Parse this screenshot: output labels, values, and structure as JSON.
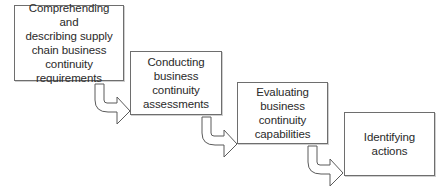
{
  "diagram": {
    "type": "process-flow-staircase",
    "steps": [
      {
        "id": 1,
        "label": "Comprehending and\ndescribing supply\nchain business\ncontinuity\nrequirements"
      },
      {
        "id": 2,
        "label": "Conducting\nbusiness\ncontinuity\nassessments"
      },
      {
        "id": 3,
        "label": "Evaluating\nbusiness\ncontinuity\ncapabilities"
      },
      {
        "id": 4,
        "label": "Identifying\nactions"
      }
    ],
    "connectors": [
      {
        "from": 1,
        "to": 2,
        "icon": "curved-arrow-down-right-icon"
      },
      {
        "from": 2,
        "to": 3,
        "icon": "curved-arrow-down-right-icon"
      },
      {
        "from": 3,
        "to": 4,
        "icon": "curved-arrow-down-right-icon"
      }
    ],
    "colors": {
      "border": "#6e6e6e",
      "text": "#2a2a2a",
      "background": "#ffffff"
    }
  }
}
